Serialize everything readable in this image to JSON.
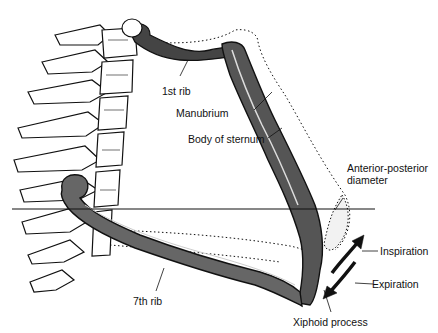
{
  "diagram": {
    "labels": {
      "first_rib": "1st rib",
      "manubrium": "Manubrium",
      "body_of_sternum": "Body of sternum",
      "ap_diameter_line1": "Anterior-posterior",
      "ap_diameter_line2": "diameter",
      "inspiration": "Inspiration",
      "expiration": "Expiration",
      "seventh_rib": "7th rib",
      "xiphoid_process": "Xiphoid process"
    },
    "annotations": {
      "solid_outline": "expiration position",
      "dotted_outline": "inspiration position",
      "horizontal_reference_line": true,
      "arrows": [
        "inspiration-up",
        "expiration-down"
      ]
    },
    "colors": {
      "ink": "#111111",
      "background": "#ffffff"
    }
  }
}
